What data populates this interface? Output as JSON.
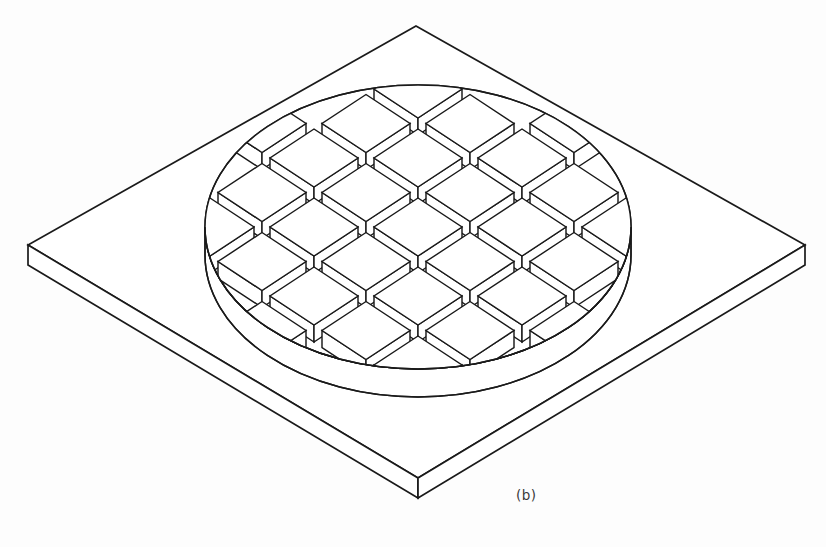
{
  "figure": {
    "caption": "(b)",
    "kind": "isometric-line-drawing",
    "line_color": "#1a1a1a",
    "fill_color": "#ffffff",
    "background_color": "#fdfdfd",
    "canvas": {
      "width": 826,
      "height": 547
    }
  },
  "base_plate": {
    "name": "square-base-plate",
    "top_vertex": {
      "x": 416,
      "y": 26
    },
    "left_vertex": {
      "x": 28,
      "y": 245
    },
    "bottom_vertex": {
      "x": 418,
      "y": 478
    },
    "right_vertex": {
      "x": 805,
      "y": 245
    },
    "thickness": 20,
    "stroke_width": 1.7
  },
  "disc": {
    "name": "circular-wafer-disc",
    "center": {
      "x": 418,
      "y": 227
    },
    "radius_x": 213,
    "radius_y": 142,
    "thickness": 28,
    "stroke_width": 1.5
  },
  "pad_grid": {
    "name": "raised-square-pad-array",
    "columns": 6,
    "rows": 6,
    "pitch_x": 104,
    "pitch_y": 69,
    "pad_half_width": 44,
    "pad_half_depth": 29,
    "pad_height": 17,
    "origin": {
      "x": 418,
      "y": 227
    },
    "clip_to_disc": true,
    "stroke_width": 1.45
  },
  "chart_data": {
    "type": "table",
    "categories": [
      "base plate",
      "disc",
      "pad array",
      "caption"
    ],
    "values": [
      1,
      1,
      28,
      1
    ]
  }
}
